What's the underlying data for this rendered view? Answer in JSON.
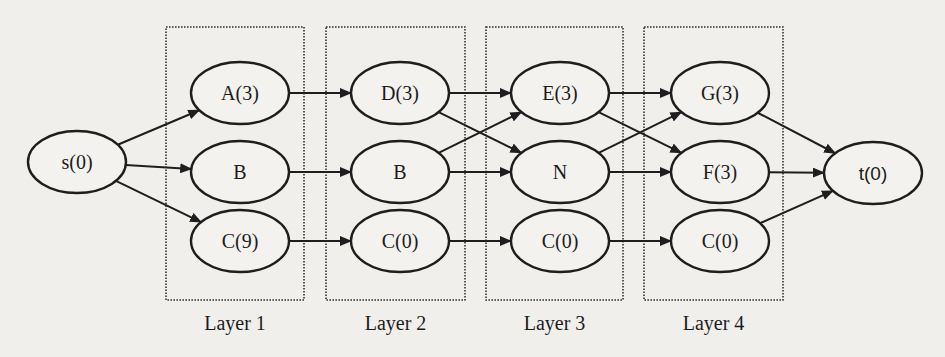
{
  "diagram": {
    "layers": [
      {
        "id": "L1",
        "label": "Layer 1",
        "box": {
          "x": 166,
          "y": 27,
          "w": 138,
          "h": 273
        }
      },
      {
        "id": "L2",
        "label": "Layer 2",
        "box": {
          "x": 326,
          "y": 27,
          "w": 139,
          "h": 273
        }
      },
      {
        "id": "L3",
        "label": "Layer 3",
        "box": {
          "x": 486,
          "y": 27,
          "w": 137,
          "h": 273
        }
      },
      {
        "id": "L4",
        "label": "Layer 4",
        "box": {
          "x": 644,
          "y": 27,
          "w": 139,
          "h": 273
        }
      }
    ],
    "nodes": [
      {
        "id": "s",
        "label": "s(0)",
        "cx": 77,
        "cy": 162,
        "layer": null
      },
      {
        "id": "A",
        "label": "A(3)",
        "cx": 240,
        "cy": 93,
        "layer": "L1"
      },
      {
        "id": "B1",
        "label": "B",
        "cx": 240,
        "cy": 172,
        "layer": "L1"
      },
      {
        "id": "C1",
        "label": "C(9)",
        "cx": 240,
        "cy": 241,
        "layer": "L1"
      },
      {
        "id": "D",
        "label": "D(3)",
        "cx": 400,
        "cy": 93,
        "layer": "L2"
      },
      {
        "id": "B2",
        "label": "B",
        "cx": 400,
        "cy": 172,
        "layer": "L2"
      },
      {
        "id": "C2",
        "label": "C(0)",
        "cx": 400,
        "cy": 241,
        "layer": "L2"
      },
      {
        "id": "E",
        "label": "E(3)",
        "cx": 560,
        "cy": 93,
        "layer": "L3"
      },
      {
        "id": "N",
        "label": "N",
        "cx": 560,
        "cy": 172,
        "layer": "L3"
      },
      {
        "id": "C3",
        "label": "C(0)",
        "cx": 560,
        "cy": 241,
        "layer": "L3"
      },
      {
        "id": "G",
        "label": "G(3)",
        "cx": 720,
        "cy": 93,
        "layer": "L4"
      },
      {
        "id": "F",
        "label": "F(3)",
        "cx": 720,
        "cy": 172,
        "layer": "L4"
      },
      {
        "id": "C4",
        "label": "C(0)",
        "cx": 720,
        "cy": 241,
        "layer": "L4"
      },
      {
        "id": "t",
        "label": "t(0)",
        "cx": 873,
        "cy": 173,
        "layer": null
      }
    ],
    "edges": [
      {
        "from": "s",
        "to": "A"
      },
      {
        "from": "s",
        "to": "B1"
      },
      {
        "from": "s",
        "to": "C1"
      },
      {
        "from": "A",
        "to": "D"
      },
      {
        "from": "B1",
        "to": "B2"
      },
      {
        "from": "C1",
        "to": "C2"
      },
      {
        "from": "D",
        "to": "E"
      },
      {
        "from": "D",
        "to": "N"
      },
      {
        "from": "B2",
        "to": "E"
      },
      {
        "from": "B2",
        "to": "N"
      },
      {
        "from": "C2",
        "to": "C3"
      },
      {
        "from": "E",
        "to": "G"
      },
      {
        "from": "E",
        "to": "F"
      },
      {
        "from": "N",
        "to": "G"
      },
      {
        "from": "N",
        "to": "F"
      },
      {
        "from": "C3",
        "to": "C4"
      },
      {
        "from": "G",
        "to": "t"
      },
      {
        "from": "F",
        "to": "t"
      },
      {
        "from": "C4",
        "to": "t"
      }
    ]
  },
  "colors": {
    "background": "#f1efec",
    "ink": "#1e1e1e"
  }
}
